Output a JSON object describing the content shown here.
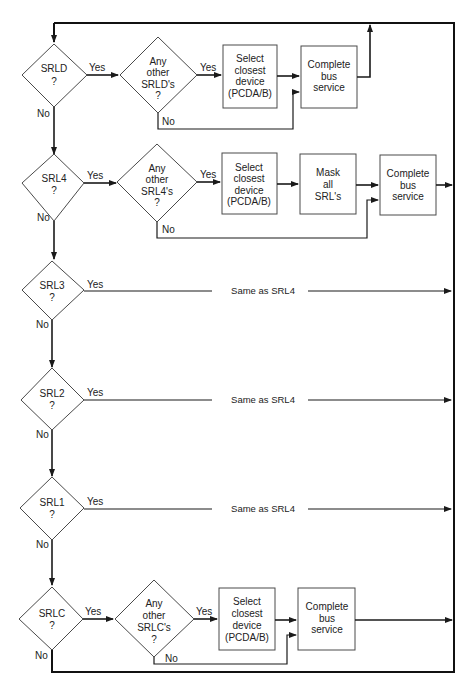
{
  "diagram": {
    "type": "flowchart",
    "colors": {
      "line": "#1a1a1a",
      "shape_border": "#4a4a4a",
      "text": "#222222",
      "background": "#ffffff"
    },
    "labels": {
      "yes": "Yes",
      "no": "No"
    },
    "rows": [
      {
        "id": "srld",
        "decision": [
          "SRLD",
          "?"
        ],
        "check": [
          "Any",
          "other",
          "SRLD's",
          "?"
        ],
        "steps": [
          [
            "Select",
            "closest",
            "device",
            "(PCDA/B)"
          ],
          [
            "Complete",
            "bus",
            "service"
          ]
        ]
      },
      {
        "id": "srl4",
        "decision": [
          "SRL4",
          "?"
        ],
        "check": [
          "Any",
          "other",
          "SRL4's",
          "?"
        ],
        "steps": [
          [
            "Select",
            "closest",
            "device",
            "(PCDA/B)"
          ],
          [
            "Mask",
            "all",
            "SRL's"
          ],
          [
            "Complete",
            "bus",
            "service"
          ]
        ]
      },
      {
        "id": "srl3",
        "decision": [
          "SRL3",
          "?"
        ],
        "same_as": "Same as SRL4"
      },
      {
        "id": "srl2",
        "decision": [
          "SRL2",
          "?"
        ],
        "same_as": "Same as SRL4"
      },
      {
        "id": "srl1",
        "decision": [
          "SRL1",
          "?"
        ],
        "same_as": "Same as SRL4"
      },
      {
        "id": "srlc",
        "decision": [
          "SRLC",
          "?"
        ],
        "check": [
          "Any",
          "other",
          "SRLC's",
          "?"
        ],
        "steps": [
          [
            "Select",
            "closest",
            "device",
            "(PCDA/B)"
          ],
          [
            "Complete",
            "bus",
            "service"
          ]
        ]
      }
    ]
  }
}
